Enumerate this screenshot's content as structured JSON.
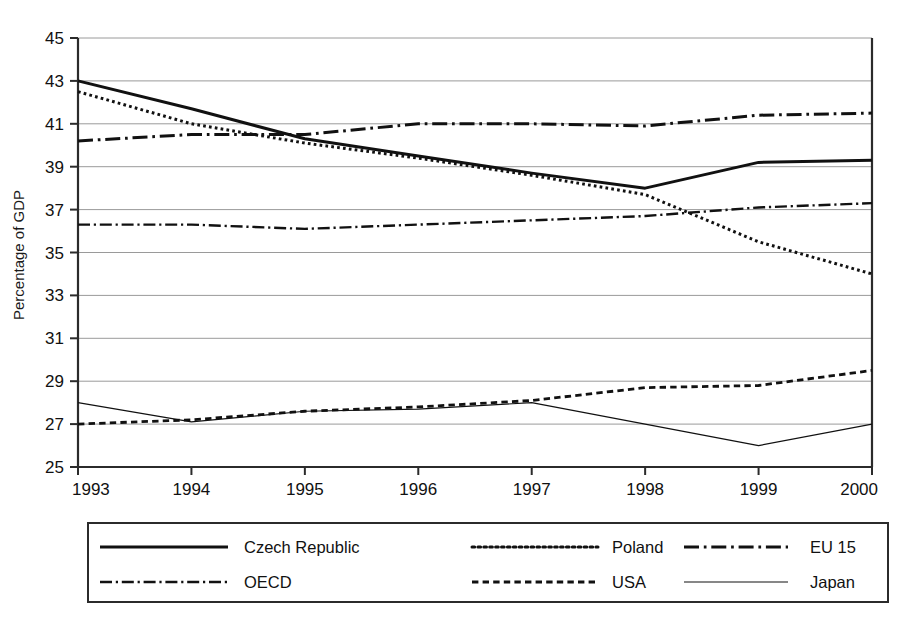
{
  "chart_data": {
    "type": "line",
    "title": "",
    "xlabel": "",
    "ylabel": "Percentage of GDP",
    "x": [
      "1993",
      "1994",
      "1995",
      "1996",
      "1997",
      "1998",
      "1999",
      "2000"
    ],
    "categories": [
      "1993",
      "1994",
      "1995",
      "1996",
      "1997",
      "1998",
      "1999",
      "2000"
    ],
    "ylim": [
      25,
      45
    ],
    "xlim": [
      "1993",
      "2000"
    ],
    "yticks": [
      25,
      27,
      29,
      31,
      33,
      35,
      37,
      39,
      41,
      43,
      45
    ],
    "ytick_labels": [
      "25",
      "27",
      "29",
      "31",
      "33",
      "35",
      "37",
      "39",
      "41",
      "43",
      "45"
    ],
    "grid": true,
    "grid_axis": "y",
    "legend_position": "below-plot",
    "legend_columns": 3,
    "series": [
      {
        "name": "Czech Republic",
        "style": "solid",
        "width": 3.0,
        "color": "#111111",
        "values": [
          43.0,
          41.7,
          40.3,
          39.5,
          38.7,
          38.0,
          39.2,
          39.3
        ]
      },
      {
        "name": "Poland",
        "style": "dotted",
        "width": 3.0,
        "color": "#111111",
        "values": [
          42.5,
          41.0,
          40.1,
          39.4,
          38.6,
          37.7,
          35.5,
          34.0
        ]
      },
      {
        "name": "EU 15",
        "style": "dash-dot",
        "width": 3.0,
        "color": "#111111",
        "values": [
          40.2,
          40.5,
          40.5,
          41.0,
          41.0,
          40.9,
          41.4,
          41.5
        ]
      },
      {
        "name": "OECD",
        "style": "dash-dot",
        "width": 2.4,
        "color": "#111111",
        "values": [
          36.3,
          36.3,
          36.1,
          36.3,
          36.5,
          36.7,
          37.1,
          37.3
        ]
      },
      {
        "name": "USA",
        "style": "dashed",
        "width": 2.8,
        "color": "#111111",
        "values": [
          27.0,
          27.2,
          27.6,
          27.8,
          28.1,
          28.7,
          28.8,
          29.5
        ]
      },
      {
        "name": "Japan",
        "style": "solid",
        "width": 1.2,
        "color": "#111111",
        "values": [
          28.0,
          27.1,
          27.6,
          27.7,
          28.0,
          27.0,
          26.0,
          27.0
        ]
      }
    ]
  },
  "legend": {
    "entries": [
      {
        "label": "Czech Republic",
        "style": "solid",
        "width": 3.0
      },
      {
        "label": "Poland",
        "style": "dotted",
        "width": 3.0
      },
      {
        "label": "EU 15",
        "style": "dash-dot",
        "width": 3.0
      },
      {
        "label": "OECD",
        "style": "dash-dot",
        "width": 2.4
      },
      {
        "label": "USA",
        "style": "dashed",
        "width": 2.8
      },
      {
        "label": "Japan",
        "style": "solid",
        "width": 1.2
      }
    ]
  }
}
